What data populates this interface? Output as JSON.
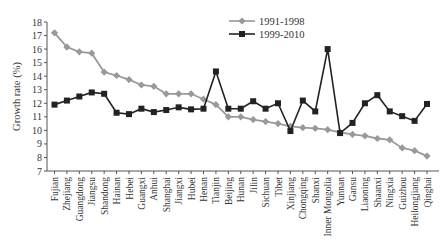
{
  "chart_data": {
    "type": "line",
    "title": "",
    "xlabel": "",
    "ylabel": "Growth rate (%)",
    "ylim": [
      7,
      18
    ],
    "yticks": [
      7,
      8,
      9,
      10,
      11,
      12,
      13,
      14,
      15,
      16,
      17,
      18
    ],
    "grid": false,
    "legend_position": "top-center",
    "categories": [
      "Fujian",
      "Zhejiang",
      "Guangdong",
      "Jiangsu",
      "Shandong",
      "Hainan",
      "Hebei",
      "Guangxi",
      "Anhui",
      "Shanghai",
      "Jiangxi",
      "Hubei",
      "Henan",
      "Tianjin",
      "Beijing",
      "Hunan",
      "Jilin",
      "Sichuan",
      "Tibet",
      "Xinjiang",
      "Chongqing",
      "Shanxi",
      "Inner Mongolia",
      "Yunnan",
      "Gansu",
      "Liaoning",
      "Shaanxi",
      "Ningxia",
      "Guizhou",
      "Heilongjiang",
      "Qinghai"
    ],
    "series": [
      {
        "name": "1991-1998",
        "color": "#999999",
        "marker": "diamond",
        "values": [
          17.2,
          16.15,
          15.8,
          15.7,
          14.3,
          14.05,
          13.75,
          13.35,
          13.25,
          12.7,
          12.7,
          12.7,
          12.3,
          11.9,
          11.0,
          11.0,
          10.8,
          10.65,
          10.5,
          10.3,
          10.2,
          10.15,
          10.05,
          9.85,
          9.7,
          9.6,
          9.4,
          9.3,
          8.7,
          8.5,
          8.1
        ]
      },
      {
        "name": "1999-2010",
        "color": "#222222",
        "marker": "square",
        "values": [
          11.9,
          12.2,
          12.5,
          12.8,
          12.7,
          11.3,
          11.2,
          11.6,
          11.35,
          11.5,
          11.7,
          11.55,
          11.6,
          14.35,
          11.6,
          11.6,
          12.15,
          11.6,
          12.0,
          9.95,
          12.2,
          11.4,
          16.0,
          9.8,
          10.55,
          12.0,
          12.6,
          11.4,
          11.05,
          10.7,
          11.95
        ]
      }
    ]
  }
}
